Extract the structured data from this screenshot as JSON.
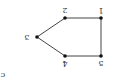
{
  "diagram": {
    "orientation": "rotated-180",
    "subfigure_label": "c",
    "colors": {
      "edge": "#444444",
      "node": "#111111",
      "text": "#333333"
    },
    "nodes": [
      {
        "id": "1",
        "label": "1"
      },
      {
        "id": "2",
        "label": "2"
      },
      {
        "id": "3",
        "label": "3"
      },
      {
        "id": "4",
        "label": "4"
      },
      {
        "id": "5",
        "label": "5"
      }
    ],
    "edges": [
      [
        "1",
        "2"
      ],
      [
        "2",
        "3"
      ],
      [
        "3",
        "4"
      ],
      [
        "4",
        "5"
      ],
      [
        "5",
        "1"
      ]
    ]
  }
}
